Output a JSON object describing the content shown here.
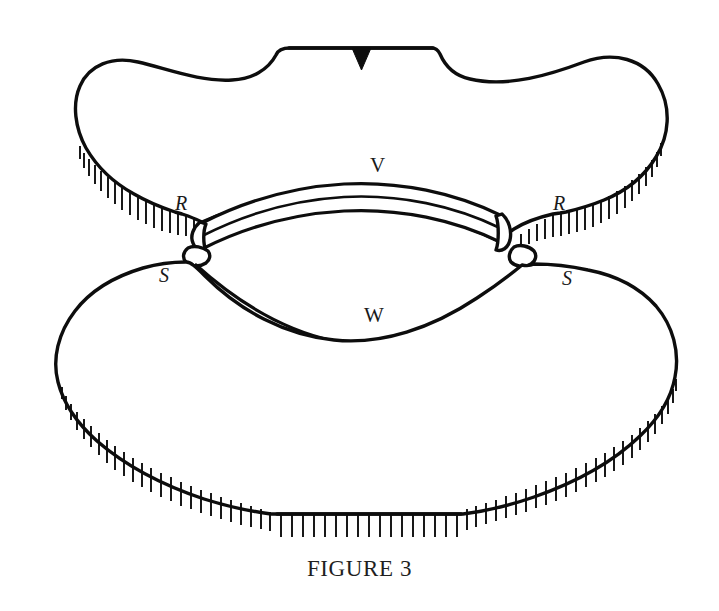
{
  "figure": {
    "caption": "FIGURE 3",
    "background_color": "#ffffff",
    "ink_color": "#0d0d0d",
    "style": "patent-line-drawing",
    "labels": [
      {
        "id": "label-v",
        "text": "V",
        "x": 370,
        "y": 155,
        "style": "upright",
        "meaning": "upper-connecting-band"
      },
      {
        "id": "label-w",
        "text": "W",
        "x": 364,
        "y": 305,
        "style": "upright",
        "meaning": "lower-connecting-band"
      },
      {
        "id": "label-r-left",
        "text": "R",
        "x": 175,
        "y": 193,
        "style": "italic",
        "meaning": "upper-junction-left"
      },
      {
        "id": "label-r-right",
        "text": "R",
        "x": 553,
        "y": 193,
        "style": "italic",
        "meaning": "upper-junction-right"
      },
      {
        "id": "label-s-left",
        "text": "S",
        "x": 159,
        "y": 265,
        "style": "italic",
        "meaning": "lower-junction-left"
      },
      {
        "id": "label-s-right",
        "text": "S",
        "x": 562,
        "y": 268,
        "style": "italic",
        "meaning": "lower-junction-right"
      }
    ],
    "parts": {
      "upper_body": "upper cross-sectioned mass with flat notched crest and hatched lower-left and lower-right cut edges",
      "lower_body": "lower cross-sectioned mass with flat hatched base",
      "band_v": "upward-arching three-line band spanning between the two R junctions",
      "band_w": "downward-arching three-line band spanning between the two S junctions",
      "notch_marker": "small solid black downward triangle on the flat upper crest"
    }
  }
}
